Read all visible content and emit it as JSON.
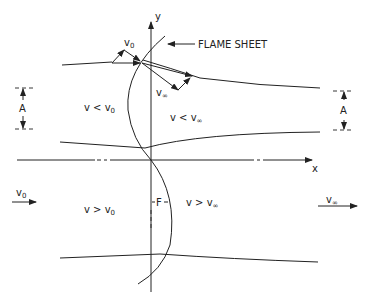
{
  "diagram": {
    "axes": {
      "x_label": "x",
      "y_label": "y"
    },
    "annotations": {
      "flame_sheet": "FLAME SHEET",
      "v0_vector": "v",
      "v0_sub": "0",
      "vinf_vector": "v",
      "vinf_sub": "∞",
      "amplitude_left": "A",
      "amplitude_right": "A",
      "flame_thickness": "F"
    },
    "regions": {
      "upper_left": {
        "text": "v < v",
        "sub": "0"
      },
      "upper_right": {
        "text": "v < v",
        "sub": "∞"
      },
      "lower_left": {
        "text": "v > v",
        "sub": "0"
      },
      "lower_right": {
        "text": "v > v",
        "sub": "∞"
      }
    },
    "flows": {
      "inlet": {
        "text": "v",
        "sub": "0"
      },
      "outlet": {
        "text": "v",
        "sub": "∞"
      }
    }
  }
}
